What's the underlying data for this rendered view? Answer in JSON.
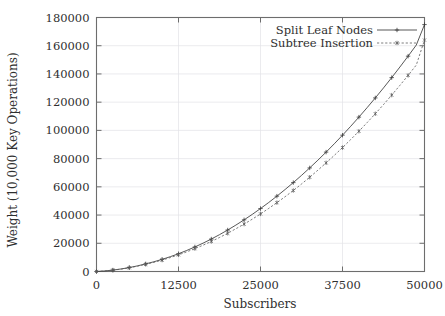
{
  "chart_data": {
    "type": "line",
    "title": "",
    "xlabel": "Subscribers",
    "ylabel": "Weight (10,000 Key Operations)",
    "xlim": [
      0,
      50000
    ],
    "ylim": [
      0,
      180000
    ],
    "xticks": [
      "0",
      "12500",
      "25000",
      "37500",
      "50000"
    ],
    "yticks": [
      "0",
      "20000",
      "40000",
      "60000",
      "80000",
      "100000",
      "120000",
      "140000",
      "160000",
      "180000"
    ],
    "xtick_values": [
      0,
      12500,
      25000,
      37500,
      50000
    ],
    "ytick_values": [
      0,
      20000,
      40000,
      60000,
      80000,
      100000,
      120000,
      140000,
      160000,
      180000
    ],
    "grid": true,
    "legend_position": "top-right",
    "x": [
      0,
      1250,
      2500,
      3750,
      5000,
      6250,
      7500,
      8750,
      10000,
      11250,
      12500,
      13750,
      15000,
      16250,
      17500,
      18750,
      20000,
      21250,
      22500,
      23750,
      25000,
      26250,
      27500,
      28750,
      30000,
      31250,
      32500,
      33750,
      35000,
      36250,
      37500,
      38750,
      40000,
      41250,
      42500,
      43750,
      45000,
      46250,
      47500,
      48750,
      50000
    ],
    "series": [
      {
        "name": "Split Leaf Nodes",
        "marker": "plus",
        "linestyle": "solid",
        "color": "#3a3a3a",
        "values": [
          0,
          400,
          1000,
          1800,
          2800,
          4000,
          5400,
          6900,
          8600,
          10500,
          12600,
          14900,
          17400,
          20100,
          23000,
          26100,
          29400,
          32900,
          36600,
          40500,
          44600,
          48900,
          53400,
          58100,
          63000,
          68100,
          73400,
          78900,
          84600,
          90500,
          96600,
          102900,
          109400,
          116100,
          123000,
          130100,
          137400,
          144900,
          152600,
          160500,
          175000
        ]
      },
      {
        "name": "Subtree Insertion",
        "marker": "star",
        "linestyle": "dashed",
        "color": "#5a5a5a",
        "values": [
          0,
          380,
          950,
          1700,
          2650,
          3780,
          5100,
          6500,
          8100,
          9850,
          11800,
          13900,
          16200,
          18650,
          21300,
          24100,
          27100,
          30300,
          33600,
          37100,
          40800,
          44700,
          48800,
          53000,
          57400,
          62000,
          66800,
          71800,
          77000,
          82300,
          87800,
          93500,
          99400,
          105500,
          111800,
          118300,
          125000,
          131900,
          139000,
          146300,
          164000
        ]
      }
    ]
  }
}
